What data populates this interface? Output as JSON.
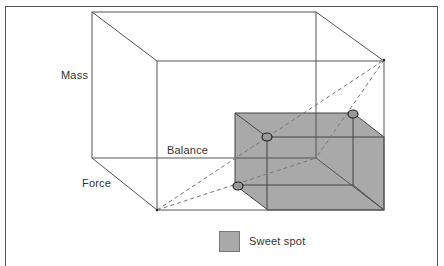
{
  "diagram": {
    "axes": {
      "mass": "Mass",
      "balance": "Balance",
      "force": "Force"
    },
    "legend": {
      "sweet_spot_label": "Sweet spot",
      "sweet_spot_color": "#a9a9a9"
    },
    "colors": {
      "line": "#555555",
      "box_fill": "#a9a9a9",
      "box_edge": "#444444",
      "dashed": "#777777",
      "marker_fill": "#999999",
      "marker_edge": "#222222"
    }
  }
}
